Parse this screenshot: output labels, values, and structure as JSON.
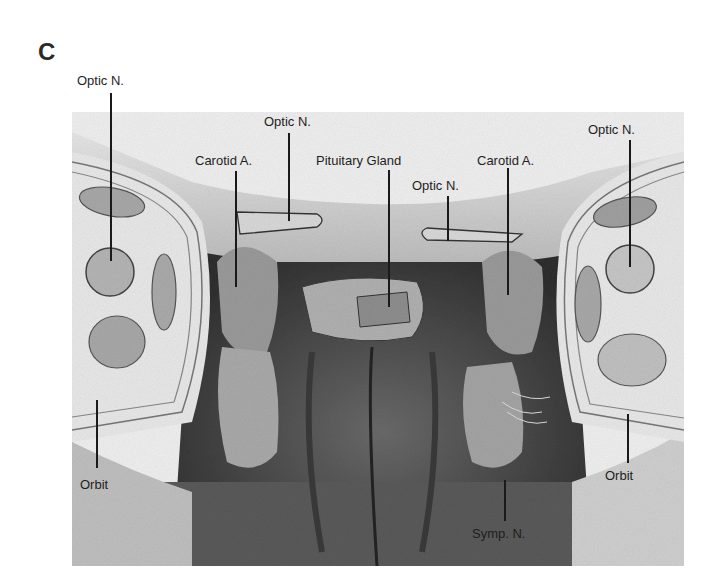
{
  "figure": {
    "panel_letter": "C",
    "labels": {
      "optic_n_far_left": "Optic N.",
      "optic_n_left": "Optic N.",
      "carotid_a_left": "Carotid A.",
      "pituitary_gland": "Pituitary Gland",
      "optic_n_center_right": "Optic N.",
      "carotid_a_right": "Carotid A.",
      "optic_n_far_right": "Optic N.",
      "orbit_left": "Orbit",
      "orbit_right": "Orbit",
      "symp_n": "Symp. N."
    }
  }
}
